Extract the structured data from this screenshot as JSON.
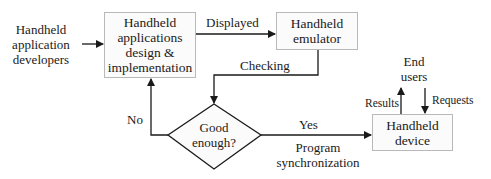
{
  "diagram": {
    "type": "flowchart",
    "nodes": {
      "developers": {
        "label": "Handheld\napplication\ndevelopers",
        "shape": "text"
      },
      "design": {
        "label": "Handheld\napplications\ndesign &\nimplementation",
        "shape": "rectangle"
      },
      "emulator": {
        "label": "Handheld\nemulator",
        "shape": "rectangle"
      },
      "decision": {
        "label": "Good\nenough?",
        "shape": "diamond"
      },
      "device": {
        "label": "Handheld\ndevice",
        "shape": "rectangle"
      },
      "end_users": {
        "label": "End\nusers",
        "shape": "text"
      }
    },
    "edges": {
      "developers_to_design": {
        "label": ""
      },
      "design_to_emulator": {
        "label": "Displayed"
      },
      "emulator_to_decision": {
        "label": "Checking"
      },
      "decision_no": {
        "label": "No"
      },
      "decision_yes": {
        "label": "Yes"
      },
      "yes_sublabel": {
        "label": "Program\nsynchronization"
      },
      "device_to_users": {
        "label": "Results"
      },
      "users_to_device": {
        "label": "Requests"
      }
    },
    "colors": {
      "line": "#1a1a1a",
      "box_border": "#b9b9b9",
      "box_fill": "#fbfbfb"
    }
  }
}
